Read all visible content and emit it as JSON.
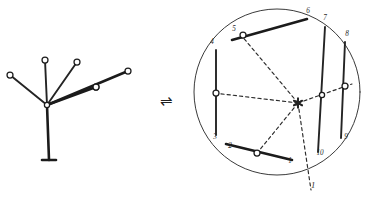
{
  "figure": {
    "background_color": "#ffffff",
    "ink_color": "#1b1b1b",
    "width": 367,
    "height": 197
  },
  "relation_symbol": {
    "name": "equilibrium-arrows",
    "glyph": "⇌",
    "meaning": "reversible / equivalent-to",
    "x": 166,
    "y": 101
  },
  "left_figure": {
    "name": "radial-tree-linkage",
    "hub": {
      "x": 47,
      "y": 105,
      "label": ""
    },
    "stem": {
      "from": {
        "x": 47,
        "y": 105
      },
      "to": {
        "x": 49,
        "y": 160
      },
      "foot_half_width": 7
    },
    "branches": [
      {
        "id": "b1",
        "label": "",
        "to": {
          "x": 10,
          "y": 75
        },
        "node_r": 3.0,
        "width": "med"
      },
      {
        "id": "b2",
        "label": "",
        "to": {
          "x": 45,
          "y": 60
        },
        "node_r": 3.0,
        "width": "med"
      },
      {
        "id": "b3",
        "label": "",
        "to": {
          "x": 77,
          "y": 62
        },
        "node_r": 3.0,
        "width": "med"
      },
      {
        "id": "b4",
        "label": "",
        "to": {
          "x": 96,
          "y": 87
        },
        "node_r": 3.0,
        "width": "thick"
      },
      {
        "id": "b5",
        "label": "",
        "to": {
          "x": 128,
          "y": 71
        },
        "node_r": 3.0,
        "width": "thick"
      }
    ]
  },
  "right_figure": {
    "name": "inscribed-polygon-in-circle",
    "circle": {
      "cx": 277,
      "cy": 92,
      "r": 83
    },
    "center_marker": {
      "x": 298,
      "y": 103,
      "name": "asterisk-hub"
    },
    "vertices": [
      {
        "label": "1",
        "x": 290,
        "y": 163
      },
      {
        "label": "2",
        "x": 230,
        "y": 148
      },
      {
        "label": "3",
        "x": 215,
        "y": 139
      },
      {
        "label": "4",
        "x": 212,
        "y": 44
      },
      {
        "label": "5",
        "x": 234,
        "y": 31
      },
      {
        "label": "6",
        "x": 308,
        "y": 13
      },
      {
        "label": "7",
        "x": 325,
        "y": 20
      },
      {
        "label": "8",
        "x": 347,
        "y": 36
      },
      {
        "label": "9",
        "x": 346,
        "y": 139
      },
      {
        "label": "10",
        "x": 320,
        "y": 155
      }
    ],
    "chords": [
      {
        "id": "c-5-6",
        "from": {
          "x": 232,
          "y": 40
        },
        "to": {
          "x": 307,
          "y": 19
        },
        "width": "thick"
      },
      {
        "id": "c-4-3",
        "from": {
          "x": 216,
          "y": 50
        },
        "to": {
          "x": 216,
          "y": 135
        },
        "width": "med"
      },
      {
        "id": "c-7-10",
        "from": {
          "x": 325,
          "y": 27
        },
        "to": {
          "x": 318,
          "y": 152
        },
        "width": "med"
      },
      {
        "id": "c-8-9",
        "from": {
          "x": 345,
          "y": 42
        },
        "to": {
          "x": 341,
          "y": 138
        },
        "width": "med"
      },
      {
        "id": "c-2-1",
        "from": {
          "x": 226,
          "y": 144
        },
        "to": {
          "x": 292,
          "y": 160
        },
        "width": "thick"
      }
    ],
    "spokes": [
      {
        "id": "s-hub-5",
        "to": {
          "x": 241,
          "y": 35
        },
        "dashed": true
      },
      {
        "id": "s-hub-4",
        "to": {
          "x": 214,
          "y": 93
        },
        "dashed": true
      },
      {
        "id": "s-hub-2",
        "to": {
          "x": 258,
          "y": 152
        },
        "dashed": true
      },
      {
        "id": "s-hub-1",
        "to": {
          "x": 311,
          "y": 190
        },
        "dashed": true
      },
      {
        "id": "s-hub-9",
        "to": {
          "x": 352,
          "y": 84
        },
        "dashed": true
      }
    ],
    "spoke_nodes": [
      {
        "id": "n-left",
        "x": 216,
        "y": 93,
        "r": 3.0
      },
      {
        "id": "n-top",
        "x": 243,
        "y": 35,
        "r": 3.0
      },
      {
        "id": "n-bottom",
        "x": 257,
        "y": 153,
        "r": 3.0
      },
      {
        "id": "n-right1",
        "x": 322,
        "y": 95,
        "r": 2.6
      },
      {
        "id": "n-right2",
        "x": 345,
        "y": 86,
        "r": 3.0
      }
    ],
    "pointer_label": {
      "text": "1",
      "x": 311,
      "y": 188
    }
  }
}
